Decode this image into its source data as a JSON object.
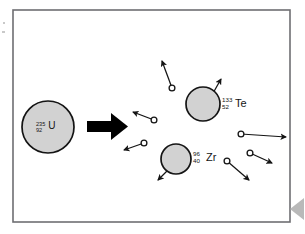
{
  "figure": {
    "frame": {
      "x": 13,
      "y": 10,
      "width": 277,
      "height": 212
    },
    "background_color": "#ffffff",
    "frame_color": "#6e6e72",
    "nucleus_fill": "#d2d2d2",
    "nucleus_stroke": "#141414",
    "neutron_fill": "#ffffff",
    "neutron_stroke": "#141414",
    "arrow_color": "#000000",
    "nav_marker_color": "#b9b9b9"
  },
  "nuclei": [
    {
      "id": "uranium",
      "name": "uranium-235",
      "mass_number": "235",
      "atomic_number": "92",
      "symbol": "U",
      "cx": 48,
      "cy": 127,
      "r": 26,
      "label_x": 36,
      "label_y": 129
    },
    {
      "id": "tellurium",
      "name": "tellurium-133",
      "mass_number": "133",
      "atomic_number": "52",
      "symbol": "Te",
      "cx": 203,
      "cy": 104,
      "r": 17,
      "label_x": 222,
      "label_y": 106
    },
    {
      "id": "zirconium",
      "name": "zirconium-96",
      "mass_number": "96",
      "atomic_number": "40",
      "symbol": "Zr",
      "cx": 176,
      "cy": 159,
      "r": 15,
      "label_x": 193,
      "label_y": 160
    }
  ],
  "fission_arrow": {
    "name": "fission-arrow",
    "description": "thick black arrow from uranium to fission products",
    "shaft_x": 87,
    "shaft_y": 121,
    "shaft_width": 24,
    "shaft_height": 11,
    "head_points": "111,113 128,126.5 111,140"
  },
  "neutrons": [
    {
      "id": "neutron-1",
      "label": "upper middle neutron moving up-left",
      "cx": 172,
      "cy": 88,
      "r": 2.9,
      "tip_x": 162,
      "tip_y": 61
    },
    {
      "id": "neutron-2",
      "label": "middle-left neutron moving up-left",
      "cx": 154,
      "cy": 120,
      "r": 2.9,
      "tip_x": 133,
      "tip_y": 112
    },
    {
      "id": "neutron-3",
      "label": "lower-left neutron moving down-left",
      "cx": 144,
      "cy": 143,
      "r": 2.9,
      "tip_x": 124,
      "tip_y": 150
    },
    {
      "id": "neutron-4",
      "label": "right neutron moving right",
      "cx": 241,
      "cy": 134,
      "r": 2.9,
      "tip_x": 286,
      "tip_y": 137
    },
    {
      "id": "neutron-5",
      "label": "right neutron moving down-right",
      "cx": 250,
      "cy": 153,
      "r": 2.9,
      "tip_x": 272,
      "tip_y": 163
    },
    {
      "id": "neutron-6",
      "label": "lower middle neutron moving down-right",
      "cx": 227,
      "cy": 161,
      "r": 2.9,
      "tip_x": 249,
      "tip_y": 180
    }
  ],
  "product_arrows": [
    {
      "id": "tellurium-momentum-arrow",
      "label": "tellurium recoil arrow up-right",
      "x1": 212,
      "y1": 95,
      "x2": 221,
      "y2": 79
    },
    {
      "id": "zirconium-momentum-arrow",
      "label": "zirconium recoil arrow down-left",
      "x1": 168,
      "y1": 170,
      "x2": 158,
      "y2": 180
    }
  ],
  "nav_marker": {
    "name": "nav-marker-left-triangle",
    "points": "304,198 290,209 304,220"
  },
  "edge_specks": [
    {
      "id": "speck-top-left",
      "x": 3,
      "y": 22,
      "w": 2,
      "h": 2
    },
    {
      "id": "speck-left",
      "x": 2,
      "y": 31,
      "w": 3,
      "h": 2
    }
  ]
}
